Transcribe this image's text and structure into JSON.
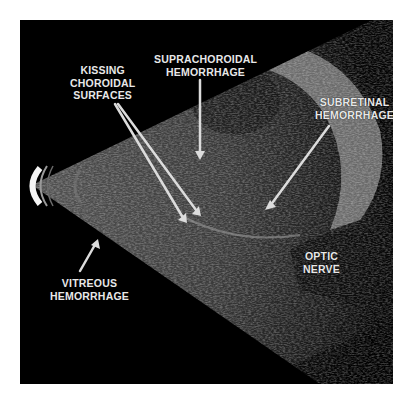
{
  "figure": {
    "type": "B-scan ocular ultrasound",
    "labels": {
      "kissing_choroidal": [
        "KISSING",
        "CHOROIDAL",
        "SURFACES"
      ],
      "suprachoroidal": [
        "SUPRACHOROIDAL",
        "HEMORRHAGE"
      ],
      "subretinal": [
        "SUBRETINAL",
        "HEMORRHAGE"
      ],
      "optic_nerve": [
        "OPTIC",
        "NERVE"
      ],
      "vitreous": [
        "VITREOUS",
        "HEMORRHAGE"
      ]
    },
    "colors": {
      "background": "#000000",
      "frame": "#ffffff",
      "label_text": "#e8e8e8",
      "arrow": "#dcdcdc"
    }
  }
}
